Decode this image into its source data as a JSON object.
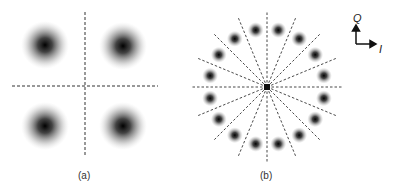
{
  "panels": [
    {
      "id": "a",
      "label": "(a)",
      "type": "constellation",
      "points": 4
    },
    {
      "id": "b",
      "label": "(b)",
      "type": "constellation",
      "points": 16,
      "decision_lines": 16
    }
  ],
  "axes": {
    "vertical": "Q",
    "horizontal": "I"
  },
  "colors": {
    "spot": "#111111",
    "dash": "#333333"
  }
}
